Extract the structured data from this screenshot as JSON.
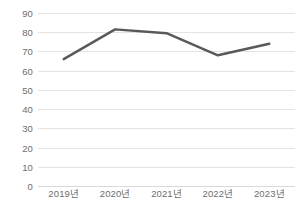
{
  "chart_data": {
    "type": "line",
    "title": "",
    "subtitle": "",
    "xlabel": "",
    "ylabel": "",
    "categories": [
      "2019년",
      "2020년",
      "2021년",
      "2022년",
      "2023년"
    ],
    "series": [
      {
        "name": "series-1",
        "values": [
          66,
          81.5,
          79.5,
          68,
          74
        ],
        "color": "#595959"
      }
    ],
    "ylim": [
      0,
      90
    ],
    "ytick_labels": [
      "90",
      "80",
      "70",
      "60",
      "50",
      "40",
      "30",
      "20",
      "10",
      "0"
    ],
    "ytick_values": [
      90,
      80,
      70,
      60,
      50,
      40,
      30,
      20,
      10,
      0
    ],
    "grid": true,
    "grid_color": "#e3e3e3",
    "legend": "none",
    "markers": false,
    "background": "#ffffff",
    "tick_label_color": "#6d6d6d"
  }
}
